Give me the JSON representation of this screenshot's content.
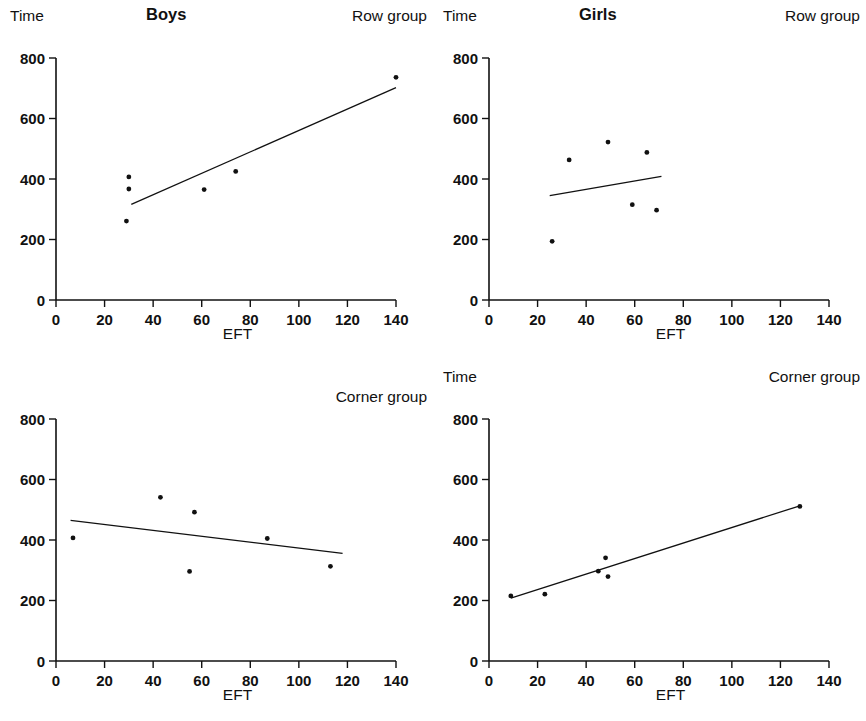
{
  "figure": {
    "axis_labels": {
      "y": "Time",
      "x": "EFT"
    },
    "y_ticks": [
      "0",
      "200",
      "400",
      "600",
      "800"
    ],
    "x_ticks": [
      "0",
      "20",
      "40",
      "60",
      "80",
      "100",
      "120",
      "140"
    ],
    "marker_color": "#111111",
    "line_color": "#111111",
    "background": "#ffffff"
  },
  "panels": [
    {
      "id": "boys-row",
      "title": "Boys",
      "group": "Row group",
      "ylabel": "Time",
      "xlabel": "EFT",
      "show_ylabel": true,
      "group_low": false
    },
    {
      "id": "girls-row",
      "title": "Girls",
      "group": "Row group",
      "ylabel": "Time",
      "xlabel": "EFT",
      "show_ylabel": true,
      "group_low": false
    },
    {
      "id": "boys-corner",
      "title": "",
      "group": "Corner group",
      "ylabel": "",
      "xlabel": "EFT",
      "show_ylabel": false,
      "group_low": true
    },
    {
      "id": "girls-corner",
      "title": "",
      "group": "Corner group",
      "ylabel": "Time",
      "xlabel": "EFT",
      "show_ylabel": true,
      "group_low": false
    }
  ],
  "chart_data": [
    {
      "type": "scatter",
      "id": "boys-row",
      "title": "Boys",
      "annotation": "Row group",
      "xlabel": "EFT",
      "ylabel": "Time",
      "xlim": [
        0,
        140
      ],
      "ylim": [
        0,
        800
      ],
      "xticks": [
        0,
        20,
        40,
        60,
        80,
        100,
        120,
        140
      ],
      "yticks": [
        0,
        200,
        400,
        600,
        800
      ],
      "grid": false,
      "legend": "none",
      "points": [
        {
          "x": 30,
          "y": 407
        },
        {
          "x": 30,
          "y": 367
        },
        {
          "x": 29,
          "y": 261
        },
        {
          "x": 61,
          "y": 365
        },
        {
          "x": 74,
          "y": 425
        },
        {
          "x": 140,
          "y": 736
        }
      ],
      "fit_line": {
        "x0": 31,
        "y0": 316,
        "x1": 140,
        "y1": 702
      }
    },
    {
      "type": "scatter",
      "id": "girls-row",
      "title": "Girls",
      "annotation": "Row group",
      "xlabel": "EFT",
      "ylabel": "Time",
      "xlim": [
        0,
        140
      ],
      "ylim": [
        0,
        800
      ],
      "xticks": [
        0,
        20,
        40,
        60,
        80,
        100,
        120,
        140
      ],
      "yticks": [
        0,
        200,
        400,
        600,
        800
      ],
      "grid": false,
      "legend": "none",
      "points": [
        {
          "x": 26,
          "y": 194
        },
        {
          "x": 33,
          "y": 463
        },
        {
          "x": 49,
          "y": 522
        },
        {
          "x": 59,
          "y": 315
        },
        {
          "x": 65,
          "y": 488
        },
        {
          "x": 69,
          "y": 297
        }
      ],
      "fit_line": {
        "x0": 25,
        "y0": 345,
        "x1": 71,
        "y1": 409
      }
    },
    {
      "type": "scatter",
      "id": "boys-corner",
      "title": "",
      "annotation": "Corner group",
      "xlabel": "EFT",
      "ylabel": "Time",
      "xlim": [
        0,
        140
      ],
      "ylim": [
        0,
        800
      ],
      "xticks": [
        0,
        20,
        40,
        60,
        80,
        100,
        120,
        140
      ],
      "yticks": [
        0,
        200,
        400,
        600,
        800
      ],
      "grid": false,
      "legend": "none",
      "points": [
        {
          "x": 7,
          "y": 407
        },
        {
          "x": 43,
          "y": 541
        },
        {
          "x": 57,
          "y": 492
        },
        {
          "x": 55,
          "y": 296
        },
        {
          "x": 87,
          "y": 405
        },
        {
          "x": 113,
          "y": 313
        }
      ],
      "fit_line": {
        "x0": 6,
        "y0": 465,
        "x1": 118,
        "y1": 356
      }
    },
    {
      "type": "scatter",
      "id": "girls-corner",
      "title": "",
      "annotation": "Corner group",
      "xlabel": "EFT",
      "ylabel": "Time",
      "xlim": [
        0,
        140
      ],
      "ylim": [
        0,
        800
      ],
      "xticks": [
        0,
        20,
        40,
        60,
        80,
        100,
        120,
        140
      ],
      "yticks": [
        0,
        200,
        400,
        600,
        800
      ],
      "grid": false,
      "legend": "none",
      "points": [
        {
          "x": 9,
          "y": 215
        },
        {
          "x": 23,
          "y": 221
        },
        {
          "x": 45,
          "y": 297
        },
        {
          "x": 48,
          "y": 341
        },
        {
          "x": 49,
          "y": 279
        },
        {
          "x": 128,
          "y": 511
        }
      ],
      "fit_line": {
        "x0": 9,
        "y0": 208,
        "x1": 128,
        "y1": 513
      }
    }
  ]
}
